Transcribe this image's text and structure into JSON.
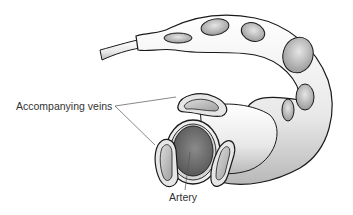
{
  "diagram": {
    "labels": {
      "veins": "Accompanying veins",
      "artery": "Artery"
    },
    "colors": {
      "outline": "#1a1a1a",
      "vessel_light": "#f2f2f2",
      "vessel_mid": "#c8c8c8",
      "lumen_dark": "#6e6e6e",
      "leader_line": "#555555",
      "label_text": "#333333"
    }
  }
}
